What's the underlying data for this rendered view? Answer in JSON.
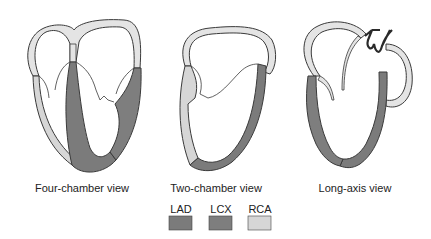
{
  "diagram": {
    "views": [
      {
        "id": "four-chamber",
        "label": "Four-chamber view"
      },
      {
        "id": "two-chamber",
        "label": "Two-chamber view"
      },
      {
        "id": "long-axis",
        "label": "Long-axis view"
      }
    ],
    "legend": [
      {
        "key": "LAD",
        "label": "LAD",
        "color": "#7b7b7b"
      },
      {
        "key": "LCX",
        "label": "LCX",
        "color": "#7e7e7e"
      },
      {
        "key": "RCA",
        "label": "RCA",
        "color": "#d6d6d6"
      }
    ],
    "colors": {
      "outline": "#3a3a3a",
      "atrial_wall": "#e4e4e4",
      "background": "#ffffff"
    }
  }
}
